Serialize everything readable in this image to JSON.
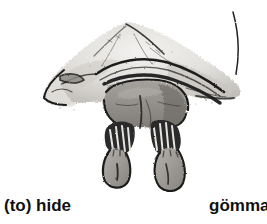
{
  "page": {
    "background_color": "#ffffff",
    "width": 267,
    "height": 224
  },
  "illustration": {
    "name": "child-hiding-under-blanket",
    "description": "Ink and grey wash drawing of a child crouching beneath a draped blanket or sheet; only the legs, trouser cuffs and two bare feet with toes are visible below the cloth, with a thin hanging cord at the upper right of the cloth.",
    "medium": "pen-and-ink with grey wash",
    "palette": {
      "ink": "#1a1a1a",
      "dark_shadow": "#3d3b39",
      "mid_gray": "#8c8a86",
      "skin_gray": "#a19e99",
      "cloth_light": "#d8d6d2",
      "cloth_pale": "#eceae7",
      "paper": "#ffffff"
    }
  },
  "captions": {
    "english": {
      "text": "(to) hide",
      "language": "English",
      "align": "left",
      "color": "#111111"
    },
    "swedish": {
      "text": "gömma",
      "language": "Swedish",
      "align": "right",
      "clipped": "true",
      "color": "#111111"
    }
  }
}
